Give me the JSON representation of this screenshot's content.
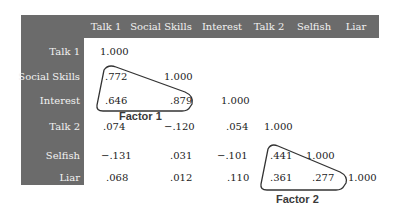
{
  "matrix": {
    "columns": [
      "Talk 1",
      "Social Skills",
      "Interest",
      "Talk 2",
      "Selfish",
      "Liar"
    ],
    "rows": [
      {
        "label": "Talk 1",
        "values": [
          "1.000"
        ]
      },
      {
        "label": "Social Skills",
        "values": [
          ".772",
          "1.000"
        ]
      },
      {
        "label": "Interest",
        "values": [
          ".646",
          ".879",
          "1.000"
        ]
      },
      {
        "label": "Talk 2",
        "values": [
          ".074",
          "−.120",
          ".054",
          "1.000"
        ]
      },
      {
        "label": "Selfish",
        "values": [
          "−.131",
          ".031",
          "−.101",
          ".441",
          "1.000"
        ]
      },
      {
        "label": "Liar",
        "values": [
          ".068",
          ".012",
          ".110",
          ".361",
          ".277",
          "1.000"
        ]
      }
    ]
  },
  "factors": [
    {
      "label": "Factor 1",
      "members": [
        "Talk 1",
        "Social Skills",
        "Interest"
      ]
    },
    {
      "label": "Factor 2",
      "members": [
        "Talk 2",
        "Selfish",
        "Liar"
      ]
    }
  ],
  "colors": {
    "header_band": "#6b6b6b",
    "header_text": "#f2f2f2",
    "cell_text": "#222222",
    "outline": "#333333"
  }
}
